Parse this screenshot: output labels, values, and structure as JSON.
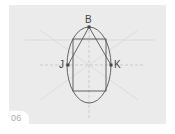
{
  "figure": {
    "step_number": "06",
    "points": {
      "B": {
        "label": "B",
        "x": 89,
        "y": 27
      },
      "J": {
        "label": "J",
        "x": 68,
        "y": 65
      },
      "K": {
        "label": "K",
        "x": 111,
        "y": 65
      }
    },
    "ellipse": {
      "cx": 89,
      "cy": 65,
      "rx": 22,
      "ry": 38
    },
    "rectangle": {
      "x": 73,
      "y": 39,
      "width": 33,
      "height": 52
    },
    "colors": {
      "background": "#ebebeb",
      "stroke": "#555555",
      "guide": "#bdbdbd",
      "label": "#444444",
      "step_label": "#aaaaaa"
    }
  }
}
